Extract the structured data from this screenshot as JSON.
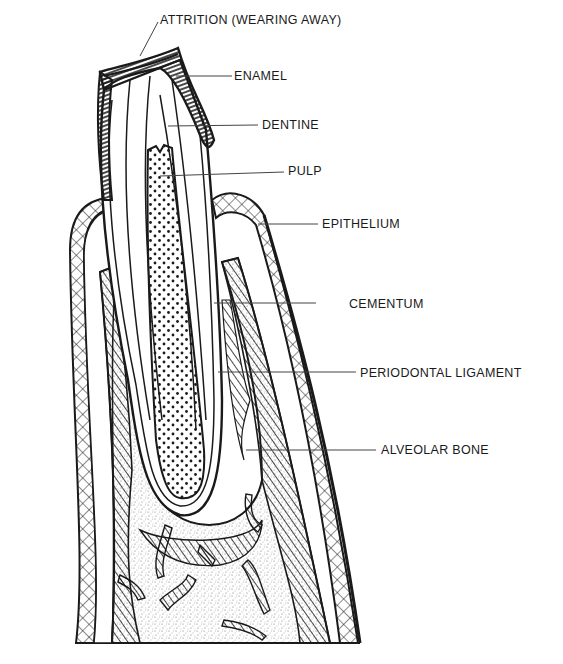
{
  "diagram": {
    "labels": {
      "attrition": "ATTRITION (WEARING AWAY)",
      "enamel": "ENAMEL",
      "dentine": "DENTINE",
      "pulp": "PULP",
      "epithelium": "EPITHELIUM",
      "cementum": "CEMENTUM",
      "periodontal_ligament": "PERIODONTAL LIGAMENT",
      "alveolar_bone": "ALVEOLAR BONE"
    },
    "colors": {
      "ink": "#1a1a1a",
      "background": "#ffffff",
      "stipple": "#9a9a9a"
    }
  }
}
